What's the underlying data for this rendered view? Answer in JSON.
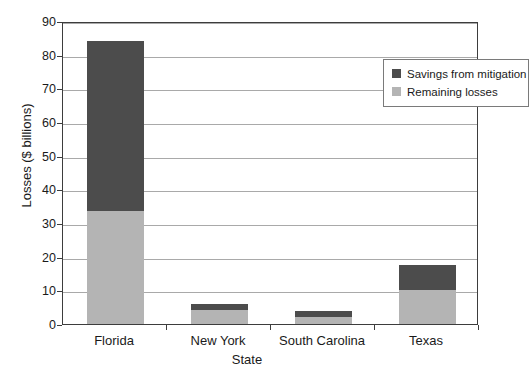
{
  "chart_data": {
    "type": "bar",
    "stacked": true,
    "title": "",
    "xlabel": "State",
    "ylabel": "Losses ($ billions)",
    "categories": [
      "Florida",
      "New York",
      "South Carolina",
      "Texas"
    ],
    "series": [
      {
        "name": "Remaining losses",
        "color": "#b4b4b4",
        "values": [
          33.5,
          4.2,
          2.0,
          10.0
        ]
      },
      {
        "name": "Savings from mitigation",
        "color": "#4c4c4c",
        "values": [
          50.5,
          1.8,
          2.0,
          7.5
        ]
      }
    ],
    "totals": [
      84,
      6,
      4,
      17.5
    ],
    "ylim": [
      0,
      90
    ],
    "ytick_step": 10,
    "yticks": [
      90,
      80,
      70,
      60,
      50,
      40,
      30,
      20,
      10,
      0
    ],
    "grid": true,
    "legend_position": "top-right",
    "legend_entries": [
      "Savings from mitigation",
      "Remaining losses"
    ]
  },
  "axes": {
    "y_title": "Losses ($ billions)",
    "x_title": "State"
  },
  "legend": {
    "items": [
      {
        "label": "Savings from mitigation",
        "color": "#4c4c4c"
      },
      {
        "label": "Remaining losses",
        "color": "#b4b4b4"
      }
    ]
  }
}
